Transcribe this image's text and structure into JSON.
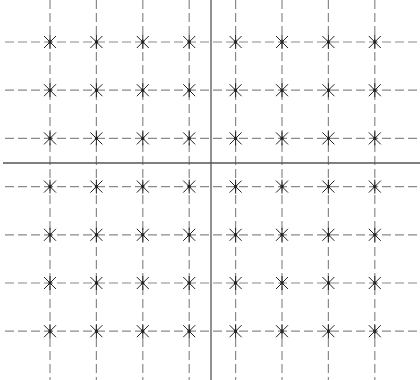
{
  "diagram": {
    "type": "grid-of-points",
    "columns": 8,
    "rows": 7,
    "axes": {
      "horizontal_axis": "solid",
      "vertical_axis": "solid"
    },
    "grid_line_style": "dashed",
    "marker": "asterisk",
    "colors": {
      "background": "#ffffff",
      "grid": "#8a8a8a",
      "axis": "#555555",
      "marker": "#222222"
    }
  }
}
